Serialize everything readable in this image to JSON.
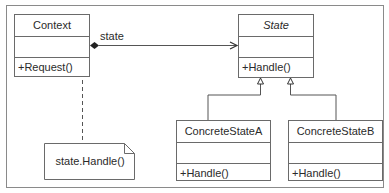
{
  "diagram": {
    "type": "uml-class-diagram",
    "pattern": "State",
    "classes": {
      "context": {
        "name": "Context",
        "operations": [
          "+Request()"
        ]
      },
      "state": {
        "name": "State",
        "abstract": true,
        "operations": [
          "+Handle()"
        ]
      },
      "concrete_a": {
        "name": "ConcreteStateA",
        "operations": [
          "+Handle()"
        ]
      },
      "concrete_b": {
        "name": "ConcreteStateB",
        "operations": [
          "+Handle()"
        ]
      }
    },
    "associations": {
      "context_state": {
        "label": "state",
        "kind": "composition",
        "from": "Context",
        "to": "State"
      }
    },
    "generalizations": [
      {
        "from": "ConcreteStateA",
        "to": "State"
      },
      {
        "from": "ConcreteStateB",
        "to": "State"
      }
    ],
    "note": {
      "text": "state.Handle()",
      "attached_to": "Context.Request()"
    },
    "colors": {
      "line": "#6a6a6a",
      "text": "#2a2a2a",
      "background": "#ffffff"
    }
  }
}
